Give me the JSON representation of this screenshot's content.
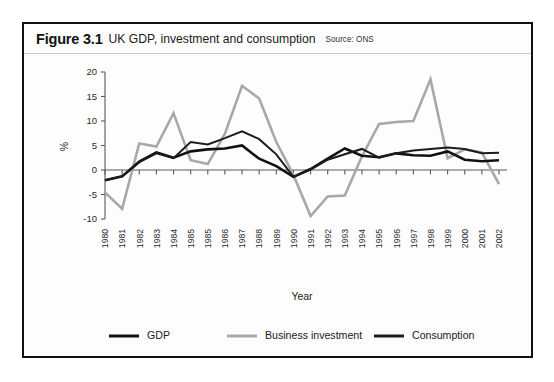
{
  "figure": {
    "number": "Figure 3.1",
    "title": "UK GDP, investment and consumption",
    "source": "Source: ONS"
  },
  "chart_data": {
    "type": "line",
    "title": "UK GDP, investment and consumption",
    "xlabel": "Year",
    "ylabel": "%",
    "ylim": [
      -10,
      20
    ],
    "yticks": [
      20,
      15,
      10,
      5,
      0,
      -5,
      -10
    ],
    "ytick_labels": [
      "20",
      "15",
      "10",
      "5",
      "0",
      "-5",
      "-10"
    ],
    "grid": false,
    "legend_position": "bottom",
    "categories": [
      "1980",
      "1981",
      "1982",
      "1983",
      "1984",
      "1985",
      "1985",
      "1986",
      "1987",
      "1988",
      "1989",
      "1990",
      "1991",
      "1992",
      "1993",
      "1994",
      "1995",
      "1996",
      "1997",
      "1998",
      "1999",
      "2000",
      "2001",
      "2002"
    ],
    "series": [
      {
        "name": "GDP",
        "color": "#111111",
        "width": 2.6,
        "values": [
          -2.1,
          -1.3,
          1.7,
          3.6,
          2.5,
          3.8,
          4.2,
          4.4,
          5.0,
          2.3,
          0.8,
          -1.4,
          0.2,
          2.3,
          4.4,
          2.9,
          2.6,
          3.4,
          3.0,
          2.9,
          3.8,
          2.1,
          1.8,
          2.0
        ]
      },
      {
        "name": "Business investment",
        "color": "#a8a8a8",
        "width": 2.6,
        "values": [
          -4.6,
          -7.9,
          5.4,
          4.8,
          11.6,
          2.0,
          1.2,
          7.4,
          17.2,
          14.6,
          5.7,
          -1.0,
          -9.4,
          -5.4,
          -5.2,
          2.8,
          9.4,
          9.8,
          10.0,
          18.5,
          2.4,
          4.2,
          3.6,
          -2.9
        ]
      },
      {
        "name": "Consumption",
        "color": "#1c1c1c",
        "width": 2.0,
        "values": [
          -2.1,
          -1.3,
          1.6,
          3.4,
          2.4,
          5.7,
          5.2,
          6.5,
          7.9,
          6.3,
          3.2,
          -1.4,
          0.1,
          2.1,
          3.2,
          4.3,
          2.5,
          3.4,
          4.0,
          4.3,
          4.6,
          4.3,
          3.4,
          3.5
        ]
      }
    ]
  },
  "legend": [
    {
      "label": "GDP",
      "color": "#111111"
    },
    {
      "label": "Business investment",
      "color": "#a8a8a8"
    },
    {
      "label": "Consumption",
      "color": "#1c1c1c"
    }
  ]
}
